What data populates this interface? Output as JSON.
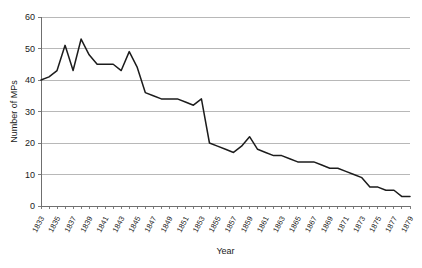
{
  "chart_data": {
    "type": "line",
    "title": "",
    "xlabel": "Year",
    "ylabel": "Number of MPs",
    "xlim": [
      1833,
      1879
    ],
    "ylim": [
      0,
      60
    ],
    "ytick_step": 10,
    "xtick_step": 1,
    "xlabel_step": 2,
    "grid": "horizontal",
    "legend": "none",
    "line_color": "#1c1c1c",
    "grid_color": "#b0b0b0",
    "axis_color": "#6f6f6f",
    "yticks": [
      0,
      10,
      20,
      30,
      40,
      50,
      60
    ],
    "xticklabels": [
      "1833",
      "1835",
      "1837",
      "1839",
      "1841",
      "1843",
      "1845",
      "1847",
      "1849",
      "1851",
      "1853",
      "1855",
      "1857",
      "1859",
      "1861",
      "1863",
      "1865",
      "1867",
      "1869",
      "1871",
      "1873",
      "1875",
      "1877",
      "1879"
    ],
    "x": [
      1833,
      1834,
      1835,
      1836,
      1837,
      1838,
      1839,
      1840,
      1841,
      1842,
      1843,
      1844,
      1845,
      1846,
      1847,
      1848,
      1849,
      1850,
      1851,
      1852,
      1853,
      1854,
      1855,
      1856,
      1857,
      1858,
      1859,
      1860,
      1861,
      1862,
      1863,
      1864,
      1865,
      1866,
      1867,
      1868,
      1869,
      1870,
      1871,
      1872,
      1873,
      1874,
      1875,
      1876,
      1877,
      1878,
      1879
    ],
    "values": [
      40,
      41,
      43,
      51,
      43,
      53,
      48,
      45,
      45,
      45,
      43,
      49,
      44,
      36,
      35,
      34,
      34,
      34,
      33,
      32,
      34,
      20,
      19,
      18,
      17,
      19,
      22,
      18,
      17,
      16,
      16,
      15,
      14,
      14,
      14,
      13,
      12,
      12,
      11,
      10,
      9,
      6,
      6,
      5,
      5,
      3,
      3
    ],
    "series_name": "Number of MPs"
  }
}
